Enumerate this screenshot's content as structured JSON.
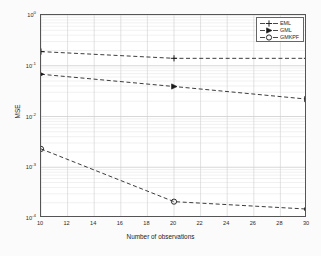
{
  "chart_data": {
    "type": "line",
    "title": "",
    "xlabel": "Number of observations",
    "ylabel": "MSE",
    "x": [
      10,
      20,
      30
    ],
    "xlim": [
      10,
      30
    ],
    "ylim": [
      0.0001,
      1
    ],
    "yscale": "log",
    "xscale": "linear",
    "grid": true,
    "legend_position": "top-right",
    "xticks": [
      "10",
      "12",
      "14",
      "16",
      "18",
      "20",
      "22",
      "24",
      "26",
      "28",
      "30"
    ],
    "xtick_values": [
      10,
      12,
      14,
      16,
      18,
      20,
      22,
      24,
      26,
      28,
      30
    ],
    "yticks": [
      "10^0",
      "10^-1",
      "10^-2",
      "10^-3",
      "10^-4"
    ],
    "ytick_values": [
      1,
      0.1,
      0.01,
      0.001,
      0.0001
    ],
    "ytick_mantissa": [
      "10",
      "10",
      "10",
      "10",
      "10"
    ],
    "ytick_exponent": [
      "0",
      "-1",
      "-2",
      "-3",
      "-4"
    ],
    "series": [
      {
        "name": "GMKPF",
        "marker": "circle",
        "linestyle": "dashed",
        "color": "#1a1a1a",
        "values": [
          0.0023,
          0.00021,
          0.00015
        ]
      },
      {
        "name": "GML",
        "marker": "right-triangle",
        "linestyle": "dashed",
        "color": "#1a1a1a",
        "values": [
          0.068,
          0.039,
          0.022
        ]
      },
      {
        "name": "EML",
        "marker": "plus",
        "linestyle": "dashed",
        "color": "#1a1a1a",
        "values": [
          0.19,
          0.14,
          0.14
        ]
      }
    ]
  },
  "legend": {
    "entries": [
      {
        "label": "GMKPF"
      },
      {
        "label": "GML"
      },
      {
        "label": "EML"
      }
    ]
  }
}
